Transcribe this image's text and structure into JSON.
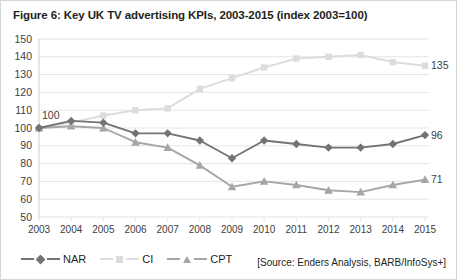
{
  "figure": {
    "title": "Figure 6: Key UK TV advertising KPIs, 2003-2015 (index 2003=100)",
    "source": "[Source: Enders Analysis, BARB/InfoSys+]"
  },
  "legend": [
    {
      "label": "NAR",
      "color": "#737373",
      "marker": "diamond"
    },
    {
      "label": "CI",
      "color": "#dcdcdc",
      "marker": "square"
    },
    {
      "label": "CPT",
      "color": "#a6a6a6",
      "marker": "triangle"
    }
  ],
  "annotations": {
    "start_label": "100",
    "end_nar": "96",
    "end_ci": "135",
    "end_cpt": "71"
  },
  "chart_data": {
    "type": "line",
    "title": "Figure 6: Key UK TV advertising KPIs, 2003-2015 (index 2003=100)",
    "xlabel": "",
    "ylabel": "",
    "ylim": [
      50,
      150
    ],
    "ytick_step": 10,
    "yticks": [
      50,
      60,
      70,
      80,
      90,
      100,
      110,
      120,
      130,
      140,
      150
    ],
    "grid": true,
    "legend_position": "bottom-left",
    "categories": [
      "2003",
      "2004",
      "2005",
      "2006",
      "2007",
      "2008",
      "2009",
      "2010",
      "2011",
      "2012",
      "2013",
      "2014",
      "2015"
    ],
    "series": [
      {
        "name": "NAR",
        "color": "#737373",
        "marker": "diamond",
        "values": [
          100,
          104,
          103,
          97,
          97,
          93,
          83,
          93,
          91,
          89,
          89,
          91,
          96
        ]
      },
      {
        "name": "CI",
        "color": "#dcdcdc",
        "marker": "square",
        "values": [
          100,
          103,
          107,
          110,
          111,
          122,
          128,
          134,
          139,
          140,
          141,
          137,
          135
        ]
      },
      {
        "name": "CPT",
        "color": "#a6a6a6",
        "marker": "triangle",
        "values": [
          100,
          101,
          100,
          92,
          89,
          79,
          67,
          70,
          68,
          65,
          64,
          68,
          71
        ]
      }
    ]
  }
}
